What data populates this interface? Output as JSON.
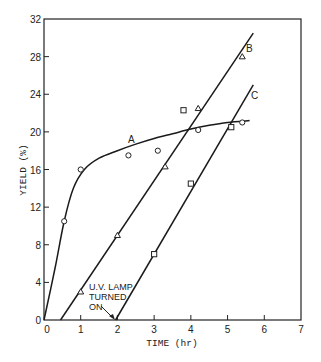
{
  "chart_data": {
    "type": "line",
    "title": "",
    "xlabel": "TIME (hr)",
    "ylabel": "YIELD (%)",
    "xlim": [
      0,
      7
    ],
    "ylim": [
      0,
      32
    ],
    "x_ticks": [
      "0",
      "1",
      "2",
      "3",
      "4",
      "5",
      "6",
      "7"
    ],
    "y_ticks": [
      "0",
      "4",
      "8",
      "12",
      "16",
      "20",
      "24",
      "28",
      "32"
    ],
    "grid": false,
    "legend": "none (curves labeled A, B, C inline)",
    "series": [
      {
        "name": "A",
        "marker": "circle",
        "points": [
          [
            0.55,
            10.5
          ],
          [
            1.0,
            16.0
          ],
          [
            2.3,
            17.5
          ],
          [
            3.1,
            18.0
          ],
          [
            4.2,
            20.2
          ],
          [
            5.4,
            21.0
          ]
        ],
        "fit_curve": [
          [
            0.0,
            0.0
          ],
          [
            0.3,
            5.5
          ],
          [
            0.55,
            10.5
          ],
          [
            0.8,
            14.0
          ],
          [
            1.1,
            16.0
          ],
          [
            1.5,
            17.2
          ],
          [
            2.0,
            18.0
          ],
          [
            2.5,
            18.7
          ],
          [
            3.0,
            19.3
          ],
          [
            3.5,
            19.8
          ],
          [
            4.0,
            20.3
          ],
          [
            4.5,
            20.7
          ],
          [
            5.0,
            21.0
          ],
          [
            5.6,
            21.2
          ]
        ]
      },
      {
        "name": "B",
        "marker": "triangle",
        "points": [
          [
            1.0,
            3.0
          ],
          [
            2.0,
            9.0
          ],
          [
            3.3,
            16.3
          ],
          [
            4.2,
            22.5
          ],
          [
            5.4,
            28.0
          ]
        ],
        "fit_line": [
          [
            0.45,
            0.0
          ],
          [
            5.7,
            30.5
          ]
        ]
      },
      {
        "name": "C",
        "marker": "square",
        "points": [
          [
            3.0,
            7.0
          ],
          [
            4.0,
            14.5
          ],
          [
            3.8,
            22.3
          ],
          [
            5.1,
            20.5
          ]
        ],
        "fit_line": [
          [
            1.95,
            0.0
          ],
          [
            5.7,
            25.0
          ]
        ]
      }
    ],
    "annotations": [
      {
        "text": "U.V. LAMP TURNED ON",
        "arrow_to": [
          1.95,
          0.0
        ]
      }
    ]
  },
  "labels": {
    "xlabel": "TIME (hr)",
    "ylabel": "YIELD (%)",
    "curve_a": "A",
    "curve_b": "B",
    "curve_c": "C",
    "annot_line1": "U.V. LAMP",
    "annot_line2": "TURNED",
    "annot_line3": "ON",
    "origin": "0"
  }
}
